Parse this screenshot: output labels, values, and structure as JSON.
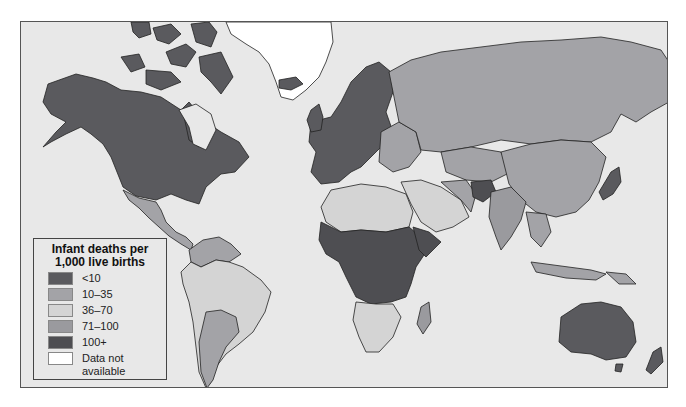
{
  "legend": {
    "title": "Infant deaths per 1,000 live births",
    "items": [
      {
        "label": "<10",
        "color": "#5a5a5e"
      },
      {
        "label": "10–35",
        "color": "#a3a3a7"
      },
      {
        "label": "36–70",
        "color": "#d4d4d4"
      },
      {
        "label": "71–100",
        "color": "#9a9a9e"
      },
      {
        "label": "100+",
        "color": "#4e4e52"
      },
      {
        "label": "Data not available",
        "color": "#ffffff"
      }
    ]
  },
  "map": {
    "ocean_color": "#e8e8e8",
    "regions": {
      "north_america": "<10",
      "greenland": "Data not available",
      "mexico_central_america": "10–35",
      "south_america": "36–70",
      "europe": "<10",
      "russia": "10–35",
      "china_mongolia": "10–35",
      "central_africa": "100+",
      "southern_africa": "36–70",
      "north_africa": "36–70",
      "middle_east": "36–70",
      "india": "71–100",
      "afghanistan": "100+",
      "japan": "<10",
      "australia": "<10",
      "new_zealand": "<10",
      "southeast_asia": "10–35"
    }
  }
}
